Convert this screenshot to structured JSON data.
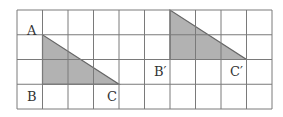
{
  "diagram": {
    "grid": {
      "x0": 17,
      "y0": 10,
      "cols": 10,
      "rows": 4,
      "cell_w": 25.5,
      "cell_h": 24.75,
      "line_color": "#7a7a7a"
    },
    "fill_color": "#b2b2b2",
    "edge_color": "#666666",
    "triangles": [
      {
        "name": "ABC",
        "points": [
          [
            1,
            1
          ],
          [
            1,
            3
          ],
          [
            4,
            3
          ]
        ]
      },
      {
        "name": "A'B'C'",
        "points": [
          [
            6,
            0
          ],
          [
            6,
            2
          ],
          [
            9,
            2
          ]
        ]
      }
    ],
    "labels": [
      {
        "text": "A",
        "x": 27,
        "y": 35
      },
      {
        "text": "B",
        "x": 27,
        "y": 101
      },
      {
        "text": "C",
        "x": 107,
        "y": 101
      },
      {
        "text": "B′",
        "x": 154,
        "y": 76
      },
      {
        "text": "C′",
        "x": 230,
        "y": 76
      }
    ]
  }
}
